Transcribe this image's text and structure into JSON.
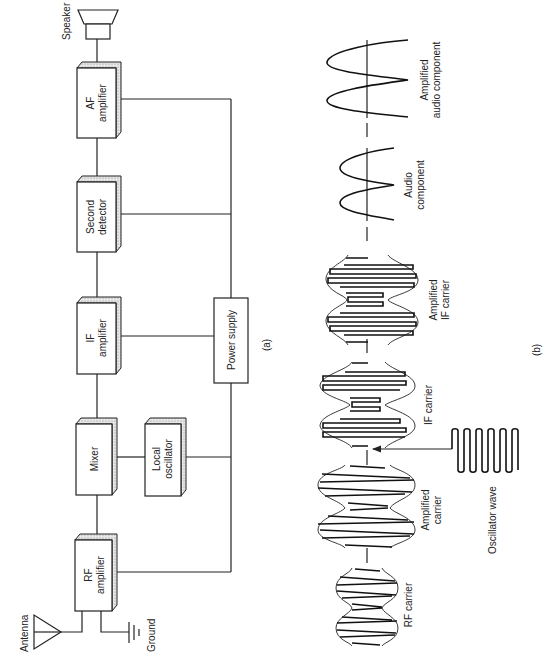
{
  "panel_a": {
    "label": "(a)",
    "blocks": [
      {
        "id": "af",
        "line1": "AF",
        "line2": "amplifier"
      },
      {
        "id": "det",
        "line1": "Second",
        "line2": "detector"
      },
      {
        "id": "if",
        "line1": "IF",
        "line2": "amplifier"
      },
      {
        "id": "mixer",
        "line1": "Mixer",
        "line2": ""
      },
      {
        "id": "lo",
        "line1": "Local",
        "line2": "oscillator"
      },
      {
        "id": "rf",
        "line1": "RF",
        "line2": "amplifier"
      },
      {
        "id": "ps",
        "line1": "Power supply",
        "line2": ""
      }
    ],
    "speaker_label": "Speaker",
    "antenna_label": "Antenna",
    "ground_label": "Ground"
  },
  "panel_b": {
    "label": "(b)",
    "waves": [
      {
        "id": "rf-carrier",
        "line1": "RF carrier",
        "line2": ""
      },
      {
        "id": "amp-carrier",
        "line1": "Amplified",
        "line2": "carrier"
      },
      {
        "id": "osc-wave",
        "line1": "Oscillator wave",
        "line2": ""
      },
      {
        "id": "if-carrier",
        "line1": "IF carrier",
        "line2": ""
      },
      {
        "id": "amp-if-carrier",
        "line1": "Amplified",
        "line2": "IF carrier"
      },
      {
        "id": "audio",
        "line1": "Audio",
        "line2": "component"
      },
      {
        "id": "amp-audio",
        "line1": "Amplified",
        "line2": "audio component"
      }
    ]
  },
  "colors": {
    "ink": "#222222",
    "paper": "#ffffff"
  }
}
